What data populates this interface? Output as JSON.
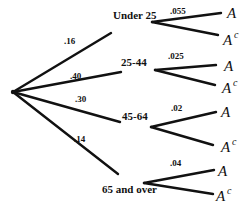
{
  "tree": {
    "root": {
      "x": 13,
      "y": 92
    },
    "branches": [
      {
        "label": "Under 25",
        "prob": ".16",
        "end": {
          "x": 111,
          "y": 33
        },
        "label_pos": {
          "x": 113,
          "y": 19
        },
        "prob_pos": {
          "x": 64,
          "y": 44
        },
        "sub_origin": {
          "x": 152,
          "y": 22
        },
        "sub_prob": ".055",
        "sub_prob_pos": {
          "x": 170,
          "y": 14
        },
        "a_end": {
          "x": 221,
          "y": 13
        },
        "ac_end": {
          "x": 218,
          "y": 35
        },
        "a_pos": {
          "x": 227,
          "y": 18
        },
        "ac_pos": {
          "x": 223,
          "y": 45
        }
      },
      {
        "label": "25-44",
        "prob": ".40",
        "end": {
          "x": 121,
          "y": 72
        },
        "label_pos": {
          "x": 121,
          "y": 66
        },
        "prob_pos": {
          "x": 70,
          "y": 79
        },
        "sub_origin": {
          "x": 155,
          "y": 70
        },
        "sub_prob": ".025",
        "sub_prob_pos": {
          "x": 168,
          "y": 59
        },
        "a_end": {
          "x": 216,
          "y": 65
        },
        "ac_end": {
          "x": 215,
          "y": 85
        },
        "a_pos": {
          "x": 224,
          "y": 71
        },
        "ac_pos": {
          "x": 222,
          "y": 93
        }
      },
      {
        "label": "45-64",
        "prob": ".30",
        "end": {
          "x": 120,
          "y": 122
        },
        "label_pos": {
          "x": 122,
          "y": 120
        },
        "prob_pos": {
          "x": 75,
          "y": 102
        },
        "sub_origin": {
          "x": 151,
          "y": 127
        },
        "sub_prob": ".02",
        "sub_prob_pos": {
          "x": 171,
          "y": 111
        },
        "a_end": {
          "x": 216,
          "y": 112
        },
        "ac_end": {
          "x": 213,
          "y": 145
        },
        "a_pos": {
          "x": 221,
          "y": 117
        },
        "ac_pos": {
          "x": 221,
          "y": 152
        }
      },
      {
        "label": "65 and over",
        "prob": ".14",
        "end": {
          "x": 118,
          "y": 174
        },
        "label_pos": {
          "x": 102,
          "y": 193
        },
        "prob_pos": {
          "x": 74,
          "y": 142
        },
        "sub_origin": {
          "x": 144,
          "y": 183
        },
        "sub_prob": ".04",
        "sub_prob_pos": {
          "x": 170,
          "y": 166
        },
        "a_end": {
          "x": 214,
          "y": 170
        },
        "ac_end": {
          "x": 213,
          "y": 194
        },
        "a_pos": {
          "x": 218,
          "y": 176
        },
        "ac_pos": {
          "x": 216,
          "y": 201
        }
      }
    ],
    "outcome_a": "A",
    "outcome_ac": "A",
    "outcome_ac_sup": "c"
  }
}
